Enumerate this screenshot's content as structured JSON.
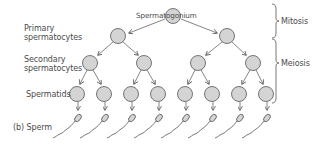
{
  "labels": {
    "spermatogonium": "Spermatogonium",
    "primary_line1": "Primary",
    "primary_line2": "spermatocytes",
    "secondary_line1": "Secondary",
    "secondary_line2": "spermatocytes",
    "spermatids": "Spermatids",
    "sperm": "(b) Sperm",
    "mitosis": "Mitosis",
    "meiosis": "Meiosis"
  },
  "colors": {
    "cell_fill": "#d4d4d4",
    "stroke": "#555555",
    "text": "#4a4a4a"
  },
  "levels": {
    "spermatogonium_count": 1,
    "primary_count": 2,
    "secondary_count": 4,
    "spermatid_count": 8,
    "sperm_count": 8
  }
}
